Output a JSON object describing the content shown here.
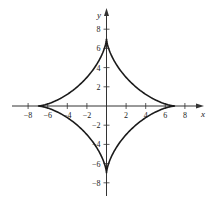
{
  "chart_data": {
    "type": "line",
    "title": "",
    "curve": "astroid",
    "equation": "x^(2/3) + y^(2/3) = 7^(2/3)",
    "parametric": {
      "x": "7cos^3(t)",
      "y": "7sin^3(t)",
      "a": 7,
      "t_range": [
        0,
        6.2832
      ]
    },
    "xlabel": "x",
    "ylabel": "y",
    "xlim": [
      -9.5,
      9.5
    ],
    "ylim": [
      -9.5,
      9.5
    ],
    "x_ticks": [
      -8,
      -6,
      -4,
      -2,
      2,
      4,
      6,
      8
    ],
    "y_ticks": [
      -8,
      -6,
      -4,
      -2,
      2,
      4,
      6,
      8
    ],
    "x_tick_labels": [
      "−8",
      "−6",
      "−4",
      "−2",
      "2",
      "4",
      "6",
      "8"
    ],
    "y_tick_labels": [
      "−8",
      "−6",
      "−4",
      "−2",
      "2",
      "4",
      "6",
      "8"
    ],
    "cusps": [
      [
        7,
        0
      ],
      [
        0,
        7
      ],
      [
        -7,
        0
      ],
      [
        0,
        -7
      ]
    ],
    "grid": false,
    "legend": null,
    "series": [
      {
        "name": "astroid",
        "color": "#1a1a1a"
      }
    ]
  },
  "colors": {
    "curve": "#1a1a1a",
    "axis": "#333333",
    "background": "#ffffff"
  }
}
